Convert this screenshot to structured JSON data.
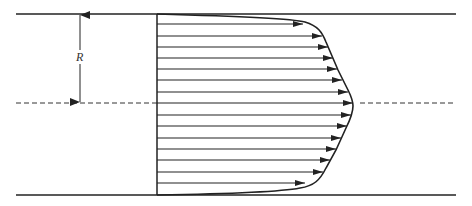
{
  "diagram": {
    "label_radius": "R",
    "colors": {
      "line": "#222222",
      "background": "#ffffff"
    },
    "geometry": {
      "pipe_left_x": 16,
      "pipe_right_x": 456,
      "top_wall_y": 14,
      "bottom_wall_y": 195,
      "centerline_y": 103,
      "profile_origin_x": 157,
      "radius_arrow_x": 80
    },
    "arrows": [
      {
        "y": 24,
        "tip_x": 303
      },
      {
        "y": 36,
        "tip_x": 322
      },
      {
        "y": 47,
        "tip_x": 328
      },
      {
        "y": 58,
        "tip_x": 333
      },
      {
        "y": 69,
        "tip_x": 337
      },
      {
        "y": 80,
        "tip_x": 342
      },
      {
        "y": 92,
        "tip_x": 348
      },
      {
        "y": 103,
        "tip_x": 353
      },
      {
        "y": 115,
        "tip_x": 351
      },
      {
        "y": 126,
        "tip_x": 347
      },
      {
        "y": 138,
        "tip_x": 341
      },
      {
        "y": 149,
        "tip_x": 336
      },
      {
        "y": 160,
        "tip_x": 330
      },
      {
        "y": 172,
        "tip_x": 323
      },
      {
        "y": 183,
        "tip_x": 305
      }
    ]
  }
}
